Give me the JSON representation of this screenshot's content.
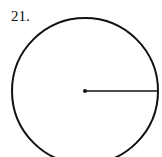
{
  "problem_number": "21.",
  "figure": {
    "shape": "circle",
    "center": [
      85,
      91
    ],
    "radius": 73,
    "radius_segment": {
      "from": "center",
      "to": "right-edge"
    },
    "stroke_color": "#111111"
  }
}
